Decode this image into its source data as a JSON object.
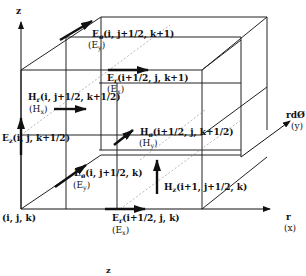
{
  "diagram": {
    "axes": {
      "z": {
        "label": "z"
      },
      "r": {
        "label": "r",
        "alt": "(x)"
      },
      "phi": {
        "label": "rdØ",
        "alt": "(y)"
      }
    },
    "origin_label": "(i, j, k)",
    "components": [
      {
        "id": "e_phi_top",
        "main": "E",
        "sub": "ø",
        "args": "(i, j+1/2, k+1)",
        "alt_main": "(E",
        "alt_sub": "y",
        "alt_end": ")"
      },
      {
        "id": "e_r_top",
        "main": "E",
        "sub": "r",
        "args": "(i+1/2, j, k+1)",
        "alt_main": "(E",
        "alt_sub": "x",
        "alt_end": ")"
      },
      {
        "id": "h_r_mid",
        "main": "H",
        "sub": "r",
        "args": "(i, j+1/2, k+1/2)",
        "alt_main": "(H",
        "alt_sub": "x",
        "alt_end": ")"
      },
      {
        "id": "e_z_mid",
        "main": "E",
        "sub": "z",
        "args": "(i, j, k+1/2)"
      },
      {
        "id": "h_phi_mid",
        "main": "H",
        "sub": "ø",
        "args": "(i+1/2, j, k+1/2)",
        "alt_main": "(H",
        "alt_sub": "y",
        "alt_end": ")"
      },
      {
        "id": "e_phi_bottom",
        "main": "E",
        "sub": "ø",
        "args": "(i, j+1/2, k)",
        "alt_main": "(E",
        "alt_sub": "y",
        "alt_end": ")"
      },
      {
        "id": "h_z_bottom",
        "main": "H",
        "sub": "z",
        "args": "(i+1, j+1/2, k)"
      },
      {
        "id": "e_r_bottom",
        "main": "E",
        "sub": "r",
        "args": "(i+1/2, j, k)",
        "alt_main": "(E",
        "alt_sub": "x",
        "alt_end": ")"
      }
    ],
    "caption_fragment": "z",
    "colors": {
      "line": "#222222",
      "arrow": "#111111",
      "dashed": "#777777",
      "background": "#ffffff"
    }
  }
}
